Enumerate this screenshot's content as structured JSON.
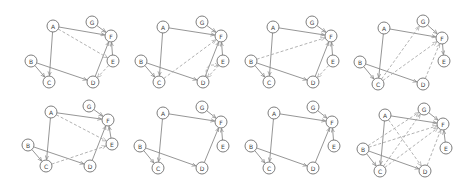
{
  "diagram": {
    "title": "",
    "node_radius": 6,
    "colors": {
      "node_stroke": "#6f6f6f",
      "edge": "#8a8a8a",
      "dashed_edge": "#a9a9a9",
      "background": "#ffffff"
    },
    "panels": [
      {
        "id": 1,
        "nodes": {
          "A": [
            53,
            26
          ],
          "B": [
            31,
            61
          ],
          "C": [
            49,
            82
          ],
          "D": [
            93,
            82
          ],
          "E": [
            113,
            61
          ],
          "F": [
            111,
            36
          ],
          "G": [
            92,
            22
          ]
        },
        "edges": [
          {
            "from": "A",
            "to": "F",
            "style": "solid"
          },
          {
            "from": "A",
            "to": "C",
            "style": "solid"
          },
          {
            "from": "G",
            "to": "F",
            "style": "solid"
          },
          {
            "from": "E",
            "to": "F",
            "style": "solid"
          },
          {
            "from": "B",
            "to": "C",
            "style": "solid"
          },
          {
            "from": "B",
            "to": "D",
            "style": "solid"
          },
          {
            "from": "D",
            "to": "F",
            "style": "solid"
          },
          {
            "from": "A",
            "to": "E",
            "style": "dashed"
          },
          {
            "from": "E",
            "to": "D",
            "style": "dashed"
          }
        ]
      },
      {
        "id": 2,
        "nodes": {
          "A": [
            163,
            27
          ],
          "B": [
            141,
            61
          ],
          "C": [
            159,
            82
          ],
          "D": [
            203,
            82
          ],
          "E": [
            223,
            61
          ],
          "F": [
            221,
            36
          ],
          "G": [
            202,
            22
          ]
        },
        "edges": [
          {
            "from": "A",
            "to": "F",
            "style": "solid"
          },
          {
            "from": "A",
            "to": "C",
            "style": "solid"
          },
          {
            "from": "G",
            "to": "F",
            "style": "solid"
          },
          {
            "from": "E",
            "to": "F",
            "style": "solid"
          },
          {
            "from": "B",
            "to": "C",
            "style": "solid"
          },
          {
            "from": "B",
            "to": "D",
            "style": "solid"
          },
          {
            "from": "D",
            "to": "F",
            "style": "solid"
          },
          {
            "from": "C",
            "to": "F",
            "style": "dashed"
          },
          {
            "from": "D",
            "to": "E",
            "style": "dashed",
            "curve": 14
          },
          {
            "from": "E",
            "to": "D",
            "style": "dashed"
          }
        ]
      },
      {
        "id": 3,
        "nodes": {
          "A": [
            273,
            27
          ],
          "B": [
            251,
            61
          ],
          "C": [
            269,
            82
          ],
          "D": [
            313,
            82
          ],
          "E": [
            333,
            61
          ],
          "F": [
            331,
            36
          ],
          "G": [
            312,
            22
          ]
        },
        "edges": [
          {
            "from": "A",
            "to": "F",
            "style": "solid"
          },
          {
            "from": "A",
            "to": "C",
            "style": "solid"
          },
          {
            "from": "G",
            "to": "F",
            "style": "solid"
          },
          {
            "from": "E",
            "to": "F",
            "style": "solid"
          },
          {
            "from": "B",
            "to": "C",
            "style": "solid"
          },
          {
            "from": "B",
            "to": "D",
            "style": "solid"
          },
          {
            "from": "D",
            "to": "F",
            "style": "solid"
          },
          {
            "from": "B",
            "to": "F",
            "style": "dashed"
          },
          {
            "from": "E",
            "to": "D",
            "style": "dashed"
          }
        ]
      },
      {
        "id": 4,
        "nodes": {
          "A": [
            384,
            28
          ],
          "B": [
            360,
            62
          ],
          "C": [
            378,
            84
          ],
          "D": [
            423,
            84
          ],
          "E": [
            444,
            61
          ],
          "F": [
            442,
            38
          ],
          "G": [
            423,
            21
          ]
        },
        "edges": [
          {
            "from": "A",
            "to": "F",
            "style": "solid"
          },
          {
            "from": "A",
            "to": "C",
            "style": "solid"
          },
          {
            "from": "G",
            "to": "F",
            "style": "solid"
          },
          {
            "from": "F",
            "to": "E",
            "style": "solid"
          },
          {
            "from": "B",
            "to": "C",
            "style": "solid"
          },
          {
            "from": "B",
            "to": "D",
            "style": "solid"
          },
          {
            "from": "D",
            "to": "F",
            "style": "dashed"
          },
          {
            "from": "C",
            "to": "G",
            "style": "dashed"
          },
          {
            "from": "C",
            "to": "F",
            "style": "dashed"
          }
        ]
      },
      {
        "id": 5,
        "nodes": {
          "A": [
            51,
            112
          ],
          "B": [
            28,
            145
          ],
          "C": [
            46,
            166
          ],
          "D": [
            90,
            166
          ],
          "E": [
            112,
            144
          ],
          "F": [
            108,
            120
          ],
          "G": [
            89,
            106
          ]
        },
        "edges": [
          {
            "from": "A",
            "to": "F",
            "style": "solid"
          },
          {
            "from": "A",
            "to": "C",
            "style": "solid"
          },
          {
            "from": "G",
            "to": "F",
            "style": "solid"
          },
          {
            "from": "E",
            "to": "F",
            "style": "solid"
          },
          {
            "from": "B",
            "to": "C",
            "style": "solid"
          },
          {
            "from": "B",
            "to": "D",
            "style": "solid"
          },
          {
            "from": "D",
            "to": "F",
            "style": "solid"
          },
          {
            "from": "A",
            "to": "E",
            "style": "dashed"
          },
          {
            "from": "C",
            "to": "E",
            "style": "dashed"
          }
        ]
      },
      {
        "id": 6,
        "nodes": {
          "A": [
            163,
            113
          ],
          "B": [
            140,
            146
          ],
          "C": [
            158,
            168
          ],
          "D": [
            202,
            168
          ],
          "E": [
            223,
            146
          ],
          "F": [
            221,
            122
          ],
          "G": [
            202,
            107
          ]
        },
        "edges": [
          {
            "from": "A",
            "to": "F",
            "style": "solid"
          },
          {
            "from": "A",
            "to": "C",
            "style": "solid"
          },
          {
            "from": "G",
            "to": "F",
            "style": "solid"
          },
          {
            "from": "E",
            "to": "F",
            "style": "solid"
          },
          {
            "from": "B",
            "to": "C",
            "style": "solid"
          },
          {
            "from": "B",
            "to": "D",
            "style": "solid"
          },
          {
            "from": "D",
            "to": "F",
            "style": "solid"
          }
        ]
      },
      {
        "id": 7,
        "nodes": {
          "A": [
            274,
            113
          ],
          "B": [
            251,
            146
          ],
          "C": [
            269,
            168
          ],
          "D": [
            313,
            168
          ],
          "E": [
            334,
            146
          ],
          "F": [
            332,
            122
          ],
          "G": [
            313,
            107
          ]
        },
        "edges": [
          {
            "from": "A",
            "to": "F",
            "style": "solid"
          },
          {
            "from": "A",
            "to": "C",
            "style": "solid"
          },
          {
            "from": "G",
            "to": "F",
            "style": "solid"
          },
          {
            "from": "E",
            "to": "F",
            "style": "solid"
          },
          {
            "from": "B",
            "to": "C",
            "style": "solid"
          },
          {
            "from": "B",
            "to": "D",
            "style": "solid"
          },
          {
            "from": "D",
            "to": "F",
            "style": "solid"
          }
        ]
      },
      {
        "id": 8,
        "nodes": {
          "A": [
            385,
            115
          ],
          "B": [
            363,
            149
          ],
          "C": [
            380,
            171
          ],
          "D": [
            425,
            171
          ],
          "E": [
            446,
            148
          ],
          "F": [
            443,
            124
          ],
          "G": [
            424,
            109
          ]
        },
        "edges": [
          {
            "from": "A",
            "to": "F",
            "style": "solid"
          },
          {
            "from": "A",
            "to": "C",
            "style": "solid"
          },
          {
            "from": "G",
            "to": "F",
            "style": "solid"
          },
          {
            "from": "E",
            "to": "F",
            "style": "solid"
          },
          {
            "from": "B",
            "to": "C",
            "style": "solid"
          },
          {
            "from": "B",
            "to": "D",
            "style": "solid"
          },
          {
            "from": "D",
            "to": "F",
            "style": "dashed"
          },
          {
            "from": "B",
            "to": "G",
            "style": "dashed"
          },
          {
            "from": "B",
            "to": "F",
            "style": "dashed"
          },
          {
            "from": "C",
            "to": "F",
            "style": "dashed"
          },
          {
            "from": "A",
            "to": "D",
            "style": "dashed"
          },
          {
            "from": "C",
            "to": "G",
            "style": "dashed"
          }
        ]
      }
    ]
  }
}
